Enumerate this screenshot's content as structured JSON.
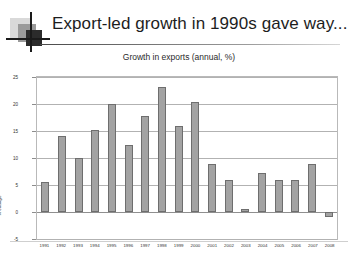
{
  "slide": {
    "title": "Export-led growth in 1990s gave way...",
    "logo_name": "decorative-square-logo"
  },
  "chart_data": {
    "type": "bar",
    "title": "Growth in exports (annual, %)",
    "xlabel": "",
    "ylabel": "% change",
    "ylim": [
      -5,
      25
    ],
    "yticks": [
      25,
      20,
      15,
      10,
      5,
      0,
      -5
    ],
    "grid": true,
    "legend": "none",
    "bar_color": "#a3a3a3",
    "bar_border_color": "#6e6e6e",
    "categories": [
      "1991",
      "1992",
      "1993",
      "1994",
      "1995",
      "1996",
      "1997",
      "1998",
      "1999",
      "2000",
      "2001",
      "2002",
      "2003",
      "2004",
      "2005",
      "2006",
      "2007",
      "2008"
    ],
    "values": [
      5.5,
      14.0,
      10.0,
      15.2,
      20.0,
      12.5,
      17.8,
      23.2,
      16.0,
      20.3,
      8.8,
      6.0,
      0.6,
      7.3,
      6.0,
      6.0,
      8.8,
      -1.0
    ]
  }
}
